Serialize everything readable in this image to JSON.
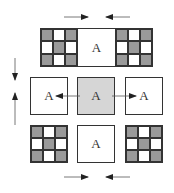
{
  "label": "A",
  "colors": {
    "shaded_cell": "#9a9a9a",
    "center_fill": "#d6d6d6",
    "stroke": "#333333"
  },
  "top_row": {
    "left_grid": [
      1,
      0,
      1,
      0,
      1,
      0,
      1,
      0,
      1
    ],
    "center_label": "A",
    "right_grid": [
      1,
      0,
      1,
      0,
      1,
      0,
      1,
      0,
      1
    ]
  },
  "middle_row": {
    "left_label": "A",
    "center_label": "A",
    "right_label": "A"
  },
  "bottom_row": {
    "left_grid": [
      1,
      0,
      1,
      0,
      1,
      0,
      1,
      0,
      1
    ],
    "center_label": "A",
    "right_grid": [
      1,
      0,
      1,
      0,
      1,
      0,
      1,
      0,
      1
    ]
  },
  "arrows": [
    {
      "name": "top-arrow-right",
      "direction": "right"
    },
    {
      "name": "top-arrow-left",
      "direction": "left"
    },
    {
      "name": "bottom-arrow-right",
      "direction": "right"
    },
    {
      "name": "bottom-arrow-left",
      "direction": "left"
    },
    {
      "name": "side-arrow-down",
      "direction": "down"
    },
    {
      "name": "side-arrow-up",
      "direction": "up"
    },
    {
      "name": "center-arrow-left",
      "direction": "left"
    },
    {
      "name": "center-arrow-right",
      "direction": "right"
    }
  ]
}
